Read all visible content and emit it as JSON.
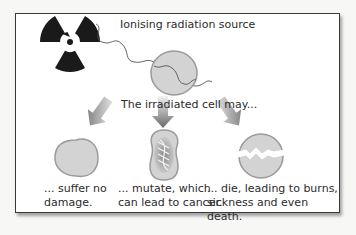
{
  "diagram": {
    "source_label": "Ionising radiation source",
    "intro_label": "The irradiated cell may...",
    "outcomes": [
      {
        "line1": "... suffer no",
        "line2": "damage."
      },
      {
        "line1": "... mutate, which",
        "line2": "can lead to cancer."
      },
      {
        "line1": "... die, leading to burns,",
        "line2": "sickness and even death."
      }
    ],
    "icons": {
      "source": "radiation-trefoil-icon",
      "ray": "wavy-radiation-ray",
      "cell": "cell",
      "arrows": "down-arrow"
    },
    "colors": {
      "cell_fill": "#d3d3d3",
      "cell_stroke": "#9a9a9a",
      "trefoil": "#1a1a1a",
      "arrow_dark": "#6e6e6e",
      "arrow_light": "#e6e6e6",
      "frame_border": "#3a3a3a"
    }
  }
}
